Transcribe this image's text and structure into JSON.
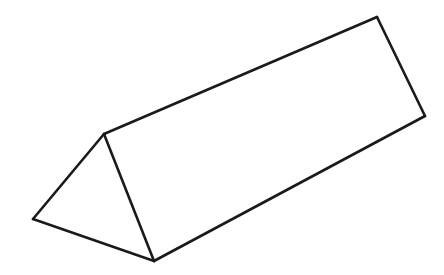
{
  "diagram": {
    "shape": "triangular-prism",
    "stroke_color": "#1a1a1a",
    "background": "#ffffff",
    "vertices": {
      "front_top": [
        104,
        134
      ],
      "front_left": [
        33,
        219
      ],
      "front_bottom": [
        154,
        261
      ],
      "back_top": [
        377,
        17
      ],
      "back_bottom": [
        425,
        116
      ]
    }
  }
}
